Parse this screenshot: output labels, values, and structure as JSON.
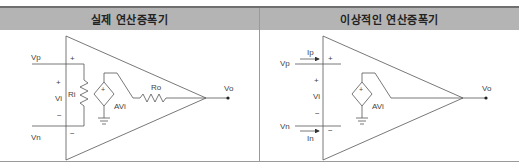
{
  "table": {
    "columns": [
      {
        "title": "실제 연산증폭기"
      },
      {
        "title": "이상적인 연산증폭기"
      }
    ]
  },
  "real_opamp": {
    "labels": {
      "vp": "Vp",
      "vn": "Vn",
      "vi": "Vi",
      "plus": "+",
      "minus": "−",
      "ri": "Ri",
      "ro": "Ro",
      "avi": "AVi",
      "vo": "Vo",
      "src_plus": "+"
    }
  },
  "ideal_opamp": {
    "labels": {
      "vp": "Vp",
      "vn": "Vn",
      "ip": "Ip",
      "in": "In",
      "vi": "Vi",
      "plus": "+",
      "minus": "−",
      "avi": "AVi",
      "vo": "Vo",
      "src_plus": "+"
    }
  },
  "colors": {
    "header_bg": "#b4b4b4",
    "line": "#555555",
    "border": "#6f6f6f"
  }
}
